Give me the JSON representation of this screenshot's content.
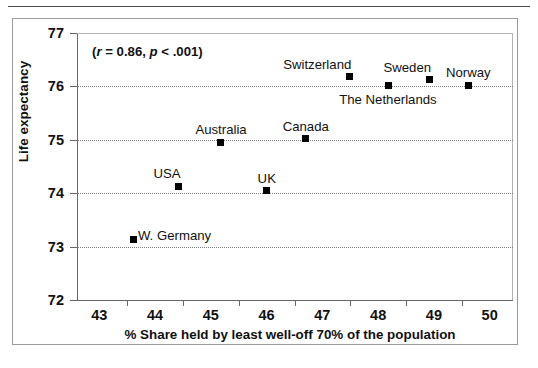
{
  "figure": {
    "annotation_prefix": "(",
    "annotation_r_symbol": "r",
    "annotation_r_value": " = 0.86, ",
    "annotation_p_symbol": "p",
    "annotation_p_value": " < .001)",
    "annotation_full": "(r = 0.86, p < .001)"
  },
  "chart_data": {
    "type": "scatter",
    "title": "",
    "xlabel": "% Share held by least well-off 70% of the population",
    "ylabel": "Life expectancy",
    "xlim": [
      42.6,
      50.4
    ],
    "ylim": [
      72,
      77
    ],
    "xticks": [
      43,
      44,
      45,
      46,
      47,
      48,
      49,
      50
    ],
    "xtick_labels": [
      "43",
      "44",
      "45",
      "46",
      "47",
      "48",
      "49",
      "50"
    ],
    "yticks": [
      72,
      73,
      74,
      75,
      76,
      77
    ],
    "ytick_labels": [
      "72",
      "73",
      "74",
      "75",
      "76",
      "77"
    ],
    "grid": "horizontal-dotted",
    "gridlines_at": [
      73,
      74,
      75,
      76
    ],
    "legend": "none",
    "marker_style": "filled-square",
    "marker_color": "#000000",
    "annotations": [
      {
        "text": "(r = 0.86, p < .001)",
        "x": 43.0,
        "y": 76.8
      }
    ],
    "points": [
      {
        "label": "W. Germany",
        "x": 43.62,
        "y": 73.13,
        "label_pos": "right"
      },
      {
        "label": "USA",
        "x": 44.42,
        "y": 74.13,
        "label_pos": "left-above"
      },
      {
        "label": "Australia",
        "x": 45.18,
        "y": 74.95,
        "label_pos": "above"
      },
      {
        "label": "UK",
        "x": 46.0,
        "y": 74.05,
        "label_pos": "above"
      },
      {
        "label": "Canada",
        "x": 46.7,
        "y": 75.02,
        "label_pos": "above"
      },
      {
        "label": "Switzerland",
        "x": 47.48,
        "y": 76.18,
        "label_pos": "left-above"
      },
      {
        "label": "The Netherlands",
        "x": 48.18,
        "y": 76.02,
        "label_pos": "below"
      },
      {
        "label": "Sweden",
        "x": 48.92,
        "y": 76.12,
        "label_pos": "left-above"
      },
      {
        "label": "Norway",
        "x": 49.62,
        "y": 76.02,
        "label_pos": "above"
      }
    ]
  }
}
